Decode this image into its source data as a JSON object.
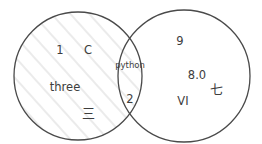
{
  "figure": {
    "kind": "venn-diagram",
    "background_color": "#ffffff",
    "stroke_color": "#4a4a4a",
    "text_color": "#3d3d3d",
    "hatch_color": "#e8e8e8"
  },
  "circles": {
    "left": {
      "name": "left-set",
      "cx": 78,
      "cy": 76,
      "r": 64,
      "filled": "hatched"
    },
    "right": {
      "name": "right-set",
      "cx": 184,
      "cy": 76,
      "r": 66,
      "filled": "none"
    }
  },
  "regions": {
    "left_only": {
      "items": [
        {
          "text": "1",
          "x": 60,
          "y": 51,
          "style": "lbl-std"
        },
        {
          "text": "C",
          "x": 88,
          "y": 51,
          "style": "lbl-std"
        },
        {
          "text": "three",
          "x": 65,
          "y": 88,
          "style": "lbl-std"
        },
        {
          "text": "三",
          "x": 88,
          "y": 113,
          "style": "lbl-cjk"
        }
      ]
    },
    "intersection": {
      "items": [
        {
          "text": "python",
          "x": 130,
          "y": 65,
          "style": "lbl-small"
        },
        {
          "text": "2",
          "x": 130,
          "y": 100,
          "style": "lbl-std"
        }
      ]
    },
    "right_only": {
      "items": [
        {
          "text": "9",
          "x": 180,
          "y": 42,
          "style": "lbl-std"
        },
        {
          "text": "8.0",
          "x": 197,
          "y": 76,
          "style": "lbl-std"
        },
        {
          "text": "VI",
          "x": 183,
          "y": 102,
          "style": "lbl-std"
        },
        {
          "text": "七",
          "x": 216,
          "y": 89,
          "style": "lbl-cjk"
        }
      ]
    }
  }
}
